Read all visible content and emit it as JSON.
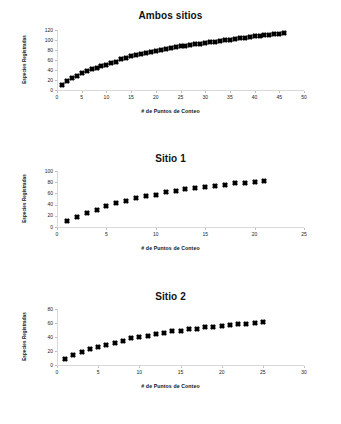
{
  "document": {
    "kind": "figure-sheet",
    "background": "#ffffff",
    "marker_color": "#000000",
    "axis_color": "#d9d9d9"
  },
  "chart_data": [
    {
      "type": "scatter",
      "title": "Ambos sitios",
      "xlabel": "# de Puntos de Conteo",
      "ylabel": "Especies Registradas",
      "xlim": [
        0,
        50
      ],
      "ylim": [
        0,
        120
      ],
      "xticks": [
        0,
        5,
        10,
        15,
        20,
        25,
        30,
        35,
        40,
        45,
        50
      ],
      "yticks": [
        0,
        20,
        40,
        60,
        80,
        100,
        120
      ],
      "grid": false,
      "legend": "none",
      "x": [
        1,
        2,
        3,
        4,
        5,
        6,
        7,
        8,
        9,
        10,
        11,
        12,
        13,
        14,
        15,
        16,
        17,
        18,
        19,
        20,
        21,
        22,
        23,
        24,
        25,
        26,
        27,
        28,
        29,
        30,
        31,
        32,
        33,
        34,
        35,
        36,
        37,
        38,
        39,
        40,
        41,
        42,
        43,
        44,
        45,
        46
      ],
      "values": [
        11,
        18,
        24,
        29,
        34,
        38,
        42,
        45,
        48,
        51,
        54,
        57,
        62,
        65,
        68,
        70,
        73,
        75,
        77,
        79,
        81,
        83,
        85,
        86,
        88,
        89,
        91,
        92,
        93,
        95,
        96,
        97,
        99,
        100,
        101,
        103,
        104,
        105,
        106,
        108,
        109,
        110,
        111,
        112,
        113,
        114
      ]
    },
    {
      "type": "scatter",
      "title": "Sitio 1",
      "xlabel": "# de Puntos de Conteo",
      "ylabel": "Especies Registradas",
      "xlim": [
        0,
        25
      ],
      "ylim": [
        0,
        100
      ],
      "xticks": [
        0,
        5,
        10,
        15,
        20,
        25
      ],
      "yticks": [
        0,
        20,
        40,
        60,
        80,
        100
      ],
      "grid": false,
      "legend": "none",
      "x": [
        1,
        2,
        3,
        4,
        5,
        6,
        7,
        8,
        9,
        10,
        11,
        12,
        13,
        14,
        15,
        16,
        17,
        18,
        19,
        20,
        21
      ],
      "values": [
        10,
        18,
        25,
        31,
        37,
        42,
        47,
        51,
        55,
        58,
        62,
        64,
        67,
        69,
        71,
        73,
        75,
        78,
        79,
        81,
        82
      ]
    },
    {
      "type": "scatter",
      "title": "Sitio 2",
      "xlabel": "# de Puntos de Conteo",
      "ylabel": "Especies Registradas",
      "xlim": [
        0,
        30
      ],
      "ylim": [
        0,
        80
      ],
      "xticks": [
        0,
        5,
        10,
        15,
        20,
        25,
        30
      ],
      "yticks": [
        0,
        20,
        40,
        60,
        80
      ],
      "grid": false,
      "legend": "none",
      "x": [
        1,
        2,
        3,
        4,
        5,
        6,
        7,
        8,
        9,
        10,
        11,
        12,
        13,
        14,
        15,
        16,
        17,
        18,
        19,
        20,
        21,
        22,
        23,
        24,
        25
      ],
      "values": [
        9,
        14,
        19,
        23,
        26,
        29,
        32,
        35,
        38,
        40,
        42,
        45,
        46,
        48,
        49,
        51,
        52,
        54,
        55,
        56,
        57,
        58,
        59,
        60,
        61
      ]
    }
  ]
}
